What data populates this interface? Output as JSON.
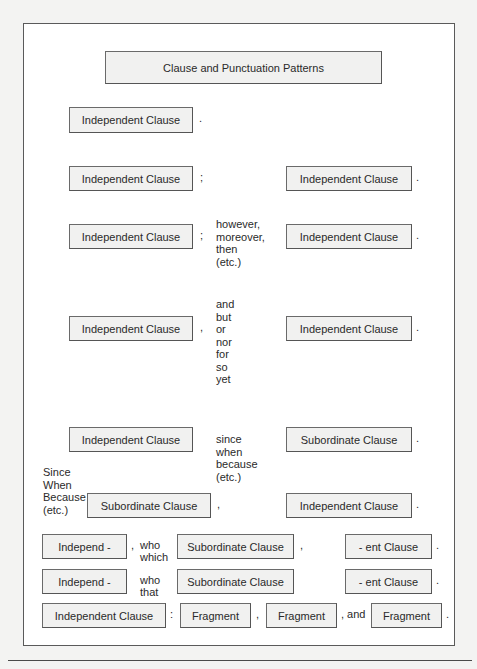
{
  "title": "Clause and Punctuation Patterns",
  "rows": [
    {
      "id": "row1",
      "left_box": "Independent Clause",
      "end_punct": "."
    },
    {
      "id": "row2",
      "left_box": "Independent Clause",
      "punct": ";",
      "right_box": "Independent Clause",
      "end_punct": "."
    },
    {
      "id": "row3",
      "left_box": "Independent Clause",
      "punct": ";",
      "connectives": [
        "however,",
        "moreover,",
        "then",
        "(etc.)"
      ],
      "right_box": "Independent Clause",
      "end_punct": "."
    },
    {
      "id": "row4",
      "left_box": "Independent Clause",
      "punct": ",",
      "connectives": [
        "and",
        "but",
        "or",
        "nor",
        "for",
        "so",
        "yet"
      ],
      "right_box": "Independent Clause",
      "end_punct": "."
    },
    {
      "id": "row5",
      "left_box": "Independent Clause",
      "connectives": [
        "since",
        "when",
        "because",
        "(etc.)"
      ],
      "right_box": "Subordinate Clause",
      "end_punct": "."
    },
    {
      "id": "row6",
      "lead_words": [
        "Since",
        "When",
        "Because",
        "(etc.)"
      ],
      "left_box": "Subordinate Clause",
      "punct": ",",
      "right_box": "Independent Clause",
      "end_punct": "."
    },
    {
      "id": "row7",
      "left_box": "Independ -",
      "punct": ",",
      "connectives": [
        "who",
        "which"
      ],
      "middle_box": "Subordinate Clause",
      "middle_punct": ",",
      "right_box": "- ent Clause",
      "end_punct": "."
    },
    {
      "id": "row8",
      "left_box": "Independ -",
      "connectives": [
        "who",
        "that"
      ],
      "middle_box": "Subordinate Clause",
      "right_box": "- ent Clause",
      "end_punct": "."
    },
    {
      "id": "row9",
      "left_box": "Independent Clause",
      "colon": ":",
      "fragments": [
        "Fragment",
        "Fragment",
        "Fragment"
      ],
      "sep1": ",",
      "sep2": ", and",
      "end_punct": "."
    }
  ]
}
